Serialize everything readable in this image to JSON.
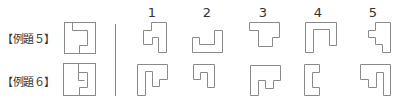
{
  "examples": [
    {
      "label": "【例題５】"
    },
    {
      "label": "【例題６】"
    }
  ],
  "columns": [
    "1",
    "2",
    "3",
    "4",
    "5"
  ],
  "colors": {
    "stroke": "#8a8a8a",
    "text": "#333333",
    "divider": "#888888"
  },
  "shapes": {
    "reference_5": "outer square with notch cut-out on right (backwards C / 'コ' profile)",
    "reference_6": "outer square with E-shaped cut region",
    "row5_options": [
      "stepped L piece",
      "U-shaped tray",
      "T-top piece",
      "inverted U piece",
      "stepped right piece"
    ],
    "row6_options": [
      "inverted-L with step",
      "small hook piece",
      "wide top with step",
      "bracket [ piece",
      "hook with step"
    ]
  }
}
